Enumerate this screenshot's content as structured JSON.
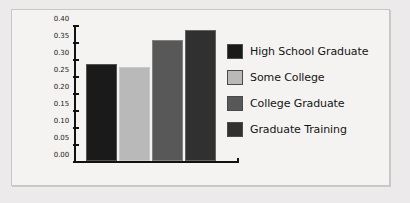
{
  "chart_data": {
    "type": "bar",
    "title": "",
    "xlabel": "",
    "ylabel": "",
    "categories": [
      "High School Graduate",
      "Some College",
      "College Graduate",
      "Graduate Training"
    ],
    "values": [
      0.29,
      0.28,
      0.36,
      0.39
    ],
    "ylim": [
      0.0,
      0.4
    ],
    "ytick_labels": [
      "0.00",
      "0.05",
      "0.10",
      "0.15",
      "0.20",
      "0.25",
      "0.30",
      "0.35",
      "0.40"
    ],
    "ytick_values": [
      0.0,
      0.05,
      0.1,
      0.15,
      0.2,
      0.25,
      0.3,
      0.35,
      0.4
    ],
    "xtick_labels": [],
    "grid": false,
    "legend_position": "right",
    "series": [
      {
        "name": "High School Graduate",
        "value": 0.29,
        "color": "#1a1a1a"
      },
      {
        "name": "Some College",
        "value": 0.28,
        "color": "#b9b9b9"
      },
      {
        "name": "College Graduate",
        "value": 0.36,
        "color": "#585858"
      },
      {
        "name": "Graduate Training",
        "value": 0.39,
        "color": "#303030"
      }
    ]
  },
  "legend": {
    "items": [
      {
        "label": "High School Graduate",
        "color": "#1a1a1a"
      },
      {
        "label": "Some College",
        "color": "#b9b9b9"
      },
      {
        "label": "College Graduate",
        "color": "#585858"
      },
      {
        "label": "Graduate Training",
        "color": "#303030"
      }
    ]
  },
  "colors": {
    "panel_background": "#f4f3f1",
    "page_background": "#eceaea",
    "panel_border": "#c9c7c5",
    "axis": "#111111",
    "text": "#151515"
  }
}
